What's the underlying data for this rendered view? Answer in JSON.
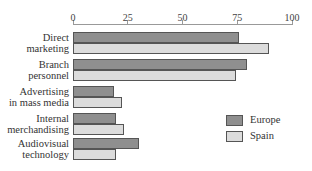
{
  "chart_data": {
    "type": "bar",
    "orientation": "horizontal",
    "title": "",
    "xlabel": "",
    "ylabel": "",
    "xlim": [
      0,
      100
    ],
    "x_ticks": [
      "0",
      "25",
      "50",
      "75",
      "100"
    ],
    "x_tick_values": [
      0,
      25,
      50,
      75,
      100
    ],
    "axis_position": "top",
    "grid": false,
    "legend_position": "right-bottom",
    "categories": [
      [
        "Direct",
        "marketing"
      ],
      [
        "Branch",
        "personnel"
      ],
      [
        "Advertising",
        "in mass media"
      ],
      [
        "Internal",
        "merchandising"
      ],
      [
        "Audiovisual",
        "technology"
      ]
    ],
    "series": [
      {
        "name": "Europe",
        "color": "#8f8f8f",
        "values": [
          76,
          79.5,
          18.5,
          19.5,
          30
        ]
      },
      {
        "name": "Spain",
        "color": "#dcdcdc",
        "values": [
          89.5,
          74.5,
          22.5,
          23.5,
          19.5
        ]
      }
    ]
  }
}
